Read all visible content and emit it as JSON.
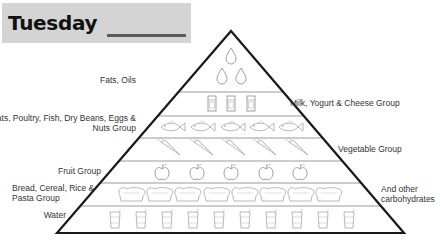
{
  "header": {
    "title": "Tuesday"
  },
  "pyramid": {
    "tiers": [
      {
        "id": "fats",
        "label": "Fats, Oils",
        "icon": "droplet-icon",
        "count": 3,
        "side": "left"
      },
      {
        "id": "dairy",
        "label": "Milk, Yogurt & Cheese Group",
        "icon": "milk-carton-icon",
        "count": 3,
        "side": "right"
      },
      {
        "id": "protein",
        "label_line1": "Meats, Poultry, Fish, Dry Beans, Eggs &",
        "label_line2": "Nuts Group",
        "icon": "fish-icon",
        "count": 5,
        "side": "left"
      },
      {
        "id": "vegetable",
        "label": "Vegetable Group",
        "icon": "carrot-icon",
        "count": 5,
        "side": "right"
      },
      {
        "id": "fruit",
        "label": "Fruit Group",
        "icon": "apple-icon",
        "count": 5,
        "side": "left"
      },
      {
        "id": "grains",
        "label_line1": "Bread, Cereal, Rice &",
        "label_line2": "Pasta Group",
        "icon": "bread-loaf-icon",
        "count": 8,
        "side": "left"
      },
      {
        "id": "grains-extra",
        "label_line1": "And other",
        "label_line2": "carbohydrates",
        "side": "right"
      },
      {
        "id": "water",
        "label": "Water",
        "icon": "water-glass-icon",
        "count": 10,
        "side": "left"
      }
    ]
  },
  "colors": {
    "outline": "#1a1a1a",
    "divider": "#9a9a9a",
    "icon_stroke": "#8a8a8a",
    "header_bg": "#d4d4d4"
  }
}
